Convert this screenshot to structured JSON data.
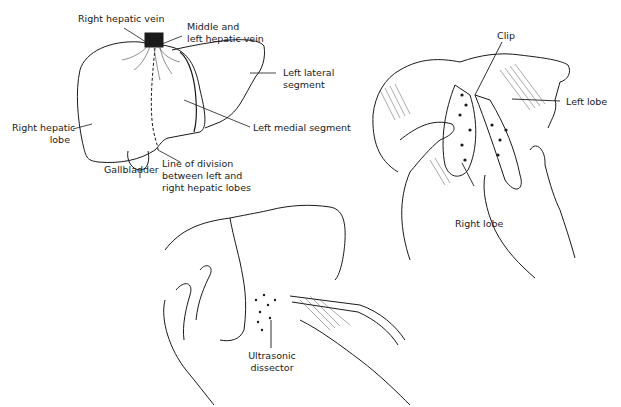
{
  "figure": {
    "panel_top_left": {
      "name": "Liver anterior view with lobe division",
      "labels": {
        "right_hepatic_vein": "Right hepatic vein",
        "middle_left_hepatic_vein_1": "Middle and",
        "middle_left_hepatic_vein_2": "left hepatic vein",
        "left_lateral_segment_1": "Left lateral",
        "left_lateral_segment_2": "segment",
        "left_medial_segment": "Left medial segment",
        "right_hepatic_lobe_1": "Right hepatic",
        "right_hepatic_lobe_2": "lobe",
        "gallbladder": "Gallbladder",
        "line_of_division_1": "Line of division",
        "line_of_division_2": "between left and",
        "line_of_division_3": "right hepatic lobes"
      }
    },
    "panel_right": {
      "name": "Hands separating liver lobes with clip",
      "labels": {
        "clip": "Clip",
        "left_lobe": "Left lobe",
        "right_lobe": "Right lobe"
      }
    },
    "panel_bottom": {
      "name": "Ultrasonic dissection of liver",
      "labels": {
        "ultrasonic_dissector_1": "Ultrasonic",
        "ultrasonic_dissector_2": "dissector"
      }
    }
  }
}
